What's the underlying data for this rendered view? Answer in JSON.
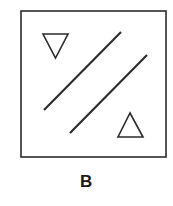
{
  "figure": {
    "caption": "B",
    "caption_color": "#1a1a1a",
    "background_color": "#ffffff",
    "stroke_color": "#2b2b2b",
    "panel": {
      "name": "square-frame",
      "x": 21,
      "y": 11,
      "width": 145,
      "height": 146,
      "stroke_width": 1.6,
      "fill": "#ffffff"
    },
    "shapes": [
      {
        "name": "triangle-down",
        "type": "triangle",
        "orientation": "down",
        "points": "43,34 68,34 55.5,58",
        "stroke_width": 1.6,
        "fill": "none"
      },
      {
        "name": "triangle-up",
        "type": "triangle",
        "orientation": "up",
        "points": "130,113 143,137 118,137",
        "stroke_width": 1.6,
        "fill": "none"
      },
      {
        "name": "diagonal-line-left",
        "type": "line",
        "x1": 44,
        "y1": 110,
        "x2": 121,
        "y2": 32,
        "stroke_width": 2.1
      },
      {
        "name": "diagonal-line-right",
        "type": "line",
        "x1": 70,
        "y1": 133,
        "x2": 147,
        "y2": 55,
        "stroke_width": 2.1
      }
    ]
  }
}
